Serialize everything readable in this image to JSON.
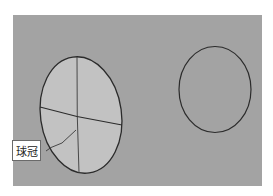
{
  "figure": {
    "background_color": "#a3a3a3",
    "cap_fill_color": "#c2c2c2",
    "stroke_color": "#2b2b2b",
    "label": {
      "text": "球冠"
    },
    "shapes": [
      {
        "name": "spherical-cap-ellipse",
        "type": "ellipse",
        "filled": true
      },
      {
        "name": "sphere-circle",
        "type": "ellipse",
        "filled": false
      }
    ]
  }
}
